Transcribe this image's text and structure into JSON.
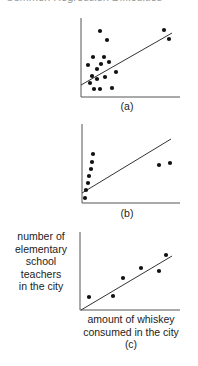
{
  "header": {
    "title": "Common Regression Difficulties"
  },
  "chart_data": [
    {
      "type": "scatter",
      "panel_label": "(a)",
      "xlabel": "",
      "ylabel": "",
      "grid": false,
      "points_px": [
        [
          100,
          31
        ],
        [
          107,
          40
        ],
        [
          93,
          57
        ],
        [
          104,
          57
        ],
        [
          88,
          65
        ],
        [
          101,
          64
        ],
        [
          109,
          62
        ],
        [
          97,
          69
        ],
        [
          116,
          72
        ],
        [
          92,
          76
        ],
        [
          105,
          77
        ],
        [
          97,
          79
        ],
        [
          90,
          83
        ],
        [
          94,
          89
        ],
        [
          100,
          89
        ],
        [
          112,
          88
        ],
        [
          164,
          30
        ],
        [
          169,
          39
        ]
      ],
      "fit_line_px": [
        [
          81,
          85
        ],
        [
          172,
          33
        ]
      ],
      "axes_px": {
        "x0": 81,
        "y0": 97,
        "x1": 180,
        "ytop": 18
      }
    },
    {
      "type": "scatter",
      "panel_label": "(b)",
      "xlabel": "",
      "ylabel": "",
      "grid": false,
      "points_px": [
        [
          93,
          154
        ],
        [
          92,
          162
        ],
        [
          91,
          169
        ],
        [
          89,
          176
        ],
        [
          88,
          183
        ],
        [
          86,
          190
        ],
        [
          85,
          198
        ],
        [
          159,
          165
        ],
        [
          170,
          163
        ]
      ],
      "fit_line_px": [
        [
          82,
          193
        ],
        [
          171,
          139
        ]
      ],
      "axes_px": {
        "x0": 82,
        "y0": 203,
        "x1": 180,
        "ytop": 124
      }
    },
    {
      "type": "scatter",
      "panel_label": "(c)",
      "xlabel": "amount of whiskey consumed in the city",
      "ylabel": "number of elementary school teachers in the city",
      "grid": false,
      "points_px": [
        [
          89,
          297
        ],
        [
          113,
          296
        ],
        [
          123,
          278
        ],
        [
          141,
          268
        ],
        [
          159,
          271
        ],
        [
          166,
          255
        ]
      ],
      "fit_line_px": [
        [
          81,
          310
        ],
        [
          172,
          256
        ]
      ],
      "axes_px": {
        "x0": 80,
        "y0": 310,
        "x1": 180,
        "ytop": 232
      }
    }
  ],
  "labels": {
    "a": "(a)",
    "b": "(b)",
    "c": "(c)",
    "c_ylabel": [
      "number of",
      "elementary",
      "school",
      "teachers",
      "in the city"
    ],
    "c_xlabel": [
      "amount of whiskey",
      "consumed in the city"
    ]
  }
}
